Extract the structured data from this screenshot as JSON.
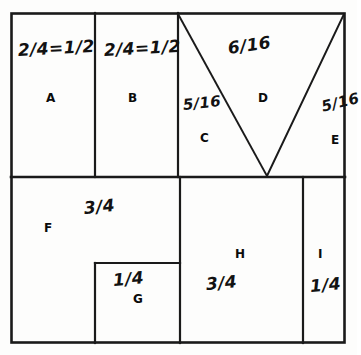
{
  "diagram": {
    "type": "geometric-partition-diagram",
    "stroke_color": "#1a1a1a",
    "background_color": "#fdfdfc",
    "frame": {
      "x": 11,
      "y": 13,
      "width": 334,
      "height": 330
    },
    "regions": [
      {
        "id": "A",
        "label": "A",
        "fraction": "2/4=1/2",
        "shape": "rectangle",
        "row": "top"
      },
      {
        "id": "B",
        "label": "B",
        "fraction": "2/4=1/2",
        "shape": "rectangle",
        "row": "top"
      },
      {
        "id": "C",
        "label": "C",
        "fraction": "5/16",
        "shape": "triangle",
        "row": "top"
      },
      {
        "id": "D",
        "label": "D",
        "fraction": "6/16",
        "shape": "triangle",
        "row": "top"
      },
      {
        "id": "E",
        "label": "E",
        "fraction": "5/16",
        "shape": "triangle",
        "row": "top"
      },
      {
        "id": "F",
        "label": "F",
        "fraction": "3/4",
        "shape": "L-shape",
        "row": "bottom"
      },
      {
        "id": "G",
        "label": "G",
        "fraction": "1/4",
        "shape": "rectangle",
        "row": "bottom"
      },
      {
        "id": "H",
        "label": "H",
        "fraction": "3/4",
        "shape": "rectangle",
        "row": "bottom"
      },
      {
        "id": "I",
        "label": "I",
        "fraction": "1/4",
        "shape": "rectangle",
        "row": "bottom"
      }
    ]
  }
}
